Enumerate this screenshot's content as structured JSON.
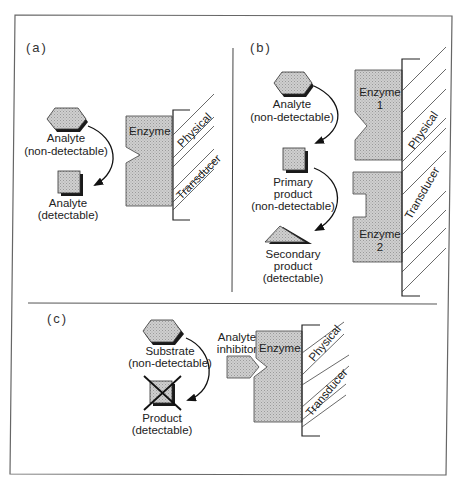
{
  "panels": {
    "a": {
      "label": "(a)",
      "analyte_nd": {
        "line1": "Analyte",
        "line2": "(non-detectable)"
      },
      "analyte_d": {
        "line1": "Analyte",
        "line2": "(detectable)"
      },
      "enzyme": "Enzyme",
      "transducer_top": "Physical",
      "transducer_bottom": "Transducer"
    },
    "b": {
      "label": "(b)",
      "analyte": {
        "line1": "Analyte",
        "line2": "(non-detectable)"
      },
      "primary": {
        "line1": "Primary",
        "line2": "product",
        "line3": "(non-detectable)"
      },
      "secondary": {
        "line1": "Secondary",
        "line2": "product",
        "line3": "(detectable)"
      },
      "enzyme1": {
        "line1": "Enzyme",
        "line2": "1"
      },
      "enzyme2": {
        "line1": "Enzyme",
        "line2": "2"
      },
      "transducer_top": "Physical",
      "transducer_bottom": "Transducer"
    },
    "c": {
      "label": "(c)",
      "substrate": {
        "line1": "Substrate",
        "line2": "(non-detectable)"
      },
      "product": {
        "line1": "Product",
        "line2": "(detectable)"
      },
      "inhibitor": {
        "line1": "Analyte",
        "line2": "inhibitor"
      },
      "enzyme": "Enzyme",
      "transducer_top": "Physical",
      "transducer_bottom": "Transducer"
    }
  },
  "colors": {
    "fill": "#c8c8c8",
    "shadow": "#1a1a1a",
    "stroke": "#222222",
    "frame": "#666666"
  }
}
